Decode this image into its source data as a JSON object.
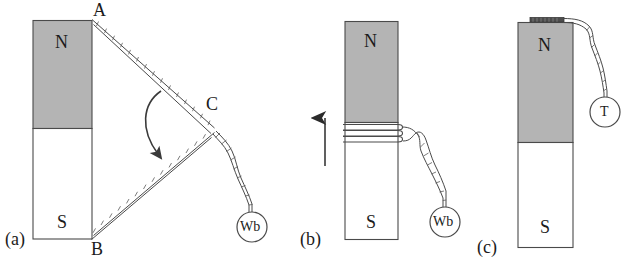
{
  "figure": {
    "caption_panels": [
      "(a)",
      "(b)",
      "(c)"
    ],
    "background_color": "#ffffff",
    "ink_color": "#3a3a3a",
    "north_pole_fill": "#b4b4b4",
    "south_pole_fill": "#ffffff"
  },
  "panel_a": {
    "label": "(a)",
    "magnet": {
      "north_label": "N",
      "south_label": "S"
    },
    "vertices": {
      "a": "A",
      "b": "B",
      "c": "C"
    },
    "meter": {
      "label": "Wb",
      "name": "fluxmeter"
    },
    "arrow": {
      "name": "search-coil-sweep-arrow"
    }
  },
  "panel_b": {
    "label": "(b)",
    "magnet": {
      "north_label": "N",
      "south_label": "S"
    },
    "meter": {
      "label": "Wb",
      "name": "fluxmeter"
    },
    "arrow": {
      "name": "coil-withdrawal-arrow",
      "direction": "up"
    },
    "coil": {
      "name": "wound-search-coil",
      "turns": 3
    }
  },
  "panel_c": {
    "label": "(c)",
    "magnet": {
      "north_label": "N",
      "south_label": "S"
    },
    "meter": {
      "label": "T",
      "name": "teslameter"
    },
    "probe": {
      "name": "hall-probe"
    }
  }
}
